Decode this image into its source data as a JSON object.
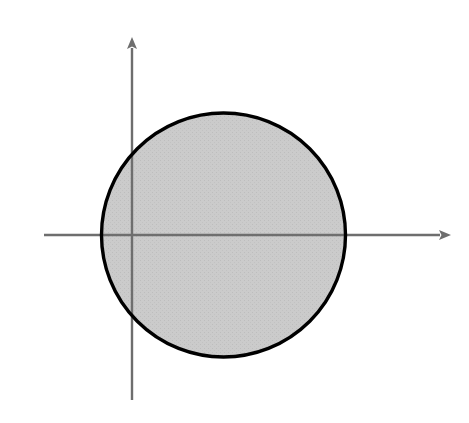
{
  "figure": {
    "kind": "math-graph",
    "width": 469,
    "height": 423,
    "background_color": "#ffffff",
    "shade_color": "#c9c9c9",
    "curve_color": "#000000",
    "axis_color": "#6e6e6e"
  },
  "axes": {
    "x_label": "x",
    "y_label": "y",
    "origin_px": {
      "x": 132,
      "y": 235
    },
    "unit_px": 30.5,
    "x_range": [
      -2.9,
      9.3
    ],
    "y_range": [
      -5.1,
      5.3
    ],
    "x_ticks": [
      {
        "value": -2,
        "label": "-2"
      },
      {
        "value": -1,
        "label": ""
      },
      {
        "value": 1,
        "label": "1"
      },
      {
        "value": 2,
        "label": "2"
      },
      {
        "value": 3,
        "label": "3"
      },
      {
        "value": 4,
        "label": "4"
      },
      {
        "value": 5,
        "label": "5"
      },
      {
        "value": 6,
        "label": "6"
      },
      {
        "value": 7,
        "label": ""
      },
      {
        "value": 8,
        "label": "8"
      }
    ],
    "y_ticks": [
      {
        "value": 4,
        "label": "4"
      },
      {
        "value": 3,
        "label": "3"
      },
      {
        "value": 2,
        "label": ""
      },
      {
        "value": 1,
        "label": "1"
      },
      {
        "value": -1,
        "label": ""
      },
      {
        "value": -2,
        "label": ""
      },
      {
        "value": -3,
        "label": "-3"
      },
      {
        "value": -4,
        "label": "-4"
      }
    ]
  },
  "chart_data": {
    "type": "line",
    "title": "",
    "xlabel": "x",
    "ylabel": "y",
    "xlim": [
      -2.9,
      9.3
    ],
    "ylim": [
      -5.1,
      5.3
    ],
    "grid": false,
    "legend": "none",
    "series": [
      {
        "name": "circle",
        "equation": "(x - 3)^2 + y^2 = 4^2",
        "shape": "circle",
        "center": [
          3,
          0
        ],
        "radius": 4,
        "stroke": "#000000",
        "stroke_width": 3
      },
      {
        "name": "parabola",
        "equation": "y = (x - 3)^2",
        "shape": "parabola",
        "vertex": [
          3,
          0
        ],
        "coefficient": 1,
        "x_domain": [
          0.73,
          5.27
        ],
        "arrowheads": [
          "start",
          "end"
        ],
        "stroke": "#000000",
        "stroke_width": 3
      }
    ],
    "shaded_region": {
      "description": "inside the circle and below/outside the parabola",
      "fill": "#c9c9c9",
      "intersections": [
        [
          0.76,
          5.05
        ],
        [
          5.24,
          5.05
        ]
      ]
    },
    "annotations": [
      {
        "text": "y = (x - 3)^2",
        "x": 5.3,
        "y": 4.6
      },
      {
        "text": "(x - 3)^2 + y^2 = 4^2",
        "x": 5.0,
        "y": -4.8
      }
    ]
  },
  "labels": {
    "parabola_equation": {
      "lhs": "y",
      "eq": "=",
      "open": "(",
      "var": "x",
      "minus": "−",
      "const": "3",
      "close": ")",
      "exp": "2"
    },
    "circle_equation": {
      "open": "(",
      "var1": "x",
      "minus": "−",
      "const": "3",
      "close": ")",
      "exp1": "2",
      "plus": "+",
      "var2": "y",
      "exp2": "2",
      "eq": "=",
      "rhs": "4",
      "exp3": "2"
    }
  }
}
